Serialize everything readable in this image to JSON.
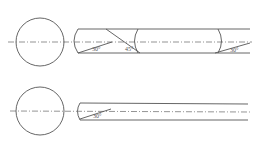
{
  "diagram": {
    "top": {
      "angle_labels": [
        "30°",
        "45°",
        "30°"
      ]
    },
    "bottom": {
      "angle_labels": [
        "30°"
      ]
    }
  }
}
